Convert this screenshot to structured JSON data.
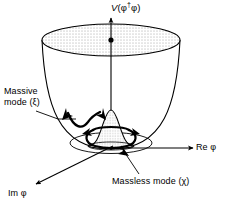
{
  "figure": {
    "background_color": "#ffffff",
    "stroke_color": "#000000",
    "stipple_color": "#555555"
  },
  "axes": {
    "vertical": {
      "name": "potential-axis",
      "label": "V(φ†φ)",
      "label_plain": "V(phi-dagger phi)",
      "direction": "up"
    },
    "real": {
      "name": "real-phi-axis",
      "label": "Re φ",
      "label_plain": "Re phi",
      "direction": "right"
    },
    "imaginary": {
      "name": "imaginary-phi-axis",
      "label": "Im φ",
      "label_plain": "Im phi",
      "direction": "down-left"
    }
  },
  "annotations": {
    "massive": {
      "line1": "Massive",
      "line2": "mode (ξ)",
      "symbol": "ξ"
    },
    "massless": {
      "text": "Massless mode (χ)",
      "symbol": "χ"
    }
  },
  "markers": {
    "origin_dot": "unstable-maximum-dot"
  }
}
